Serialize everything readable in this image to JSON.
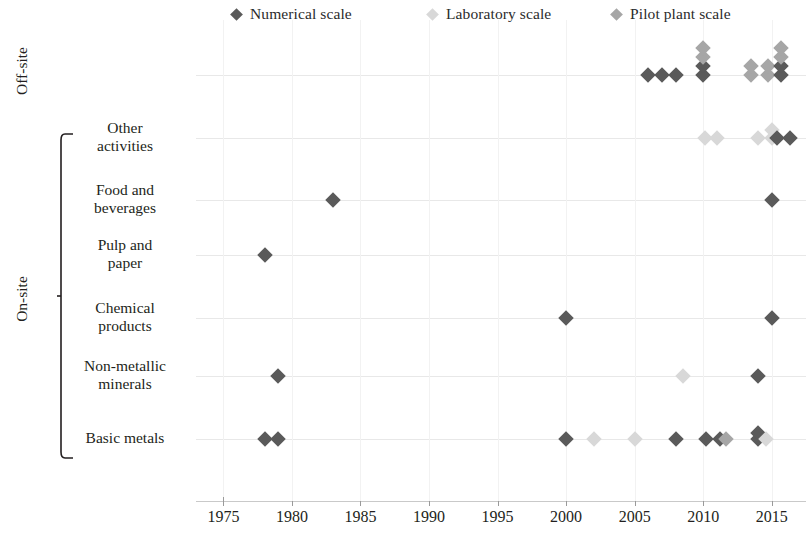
{
  "legend": {
    "entries": [
      {
        "label": "Numerical scale",
        "color": "#5a5a5a",
        "x": 232
      },
      {
        "label": "Laboratory scale",
        "color": "#d8d8d8",
        "x": 428
      },
      {
        "label": "Pilot plant  scale",
        "color": "#a6a6a6",
        "x": 612
      }
    ]
  },
  "axes": {
    "group_titles": [
      {
        "label": "Off-site"
      },
      {
        "label": "On-site"
      }
    ],
    "categories": [
      "Other\nactivities",
      "Food and\nbeverages",
      "Pulp and\npaper",
      "Chemical\nproducts",
      "Non-metallic\nminerals",
      "Basic metals"
    ],
    "x_ticks": [
      1975,
      1980,
      1985,
      1990,
      1995,
      2000,
      2005,
      2010,
      2015
    ],
    "x_tick_labels": [
      "1975",
      "1980",
      "1985",
      "1990",
      "1995",
      "2000",
      "2005",
      "2010",
      "2015"
    ]
  },
  "chart_data": {
    "type": "scatter",
    "title": "",
    "xlabel": "",
    "ylabel": "",
    "xlim": [
      1973,
      2017.5
    ],
    "grid": true,
    "legend_position": "top",
    "series": [
      {
        "name": "Numerical scale",
        "color": "#5a5a5a"
      },
      {
        "name": "Laboratory scale",
        "color": "#d8d8d8"
      },
      {
        "name": "Pilot plant  scale",
        "color": "#a6a6a6"
      }
    ],
    "rows": [
      {
        "category": "Off-site",
        "group": "Off-site",
        "points": [
          {
            "x": 2006.0,
            "series": "Numerical scale",
            "jitter": 0
          },
          {
            "x": 2007.0,
            "series": "Numerical scale",
            "jitter": 0
          },
          {
            "x": 2008.0,
            "series": "Numerical scale",
            "jitter": 0
          },
          {
            "x": 2010.0,
            "series": "Numerical scale",
            "jitter": 0
          },
          {
            "x": 2010.0,
            "series": "Numerical scale",
            "jitter": -9
          },
          {
            "x": 2010.0,
            "series": "Pilot plant  scale",
            "jitter": -18
          },
          {
            "x": 2010.0,
            "series": "Pilot plant  scale",
            "jitter": -27
          },
          {
            "x": 2013.5,
            "series": "Pilot plant  scale",
            "jitter": 0
          },
          {
            "x": 2013.5,
            "series": "Pilot plant  scale",
            "jitter": -9
          },
          {
            "x": 2014.7,
            "series": "Pilot plant  scale",
            "jitter": 0
          },
          {
            "x": 2014.7,
            "series": "Pilot plant  scale",
            "jitter": -9
          },
          {
            "x": 2015.7,
            "series": "Numerical scale",
            "jitter": 0
          },
          {
            "x": 2015.7,
            "series": "Numerical scale",
            "jitter": -9
          },
          {
            "x": 2015.7,
            "series": "Pilot plant  scale",
            "jitter": -18
          },
          {
            "x": 2015.7,
            "series": "Pilot plant  scale",
            "jitter": -27
          }
        ]
      },
      {
        "category": "Other\nactivities",
        "group": "On-site",
        "points": [
          {
            "x": 2010.1,
            "series": "Laboratory scale",
            "jitter": 0
          },
          {
            "x": 2011.0,
            "series": "Laboratory scale",
            "jitter": 0
          },
          {
            "x": 2014.0,
            "series": "Laboratory scale",
            "jitter": 0
          },
          {
            "x": 2015.0,
            "series": "Laboratory scale",
            "jitter": 0
          },
          {
            "x": 2015.0,
            "series": "Laboratory scale",
            "jitter": -8
          },
          {
            "x": 2015.4,
            "series": "Numerical scale",
            "jitter": 0
          },
          {
            "x": 2016.3,
            "series": "Numerical scale",
            "jitter": 0
          }
        ]
      },
      {
        "category": "Food and\nbeverages",
        "group": "On-site",
        "points": [
          {
            "x": 1983.0,
            "series": "Numerical scale",
            "jitter": 0
          },
          {
            "x": 2015.0,
            "series": "Numerical scale",
            "jitter": 0
          }
        ]
      },
      {
        "category": "Pulp and\npaper",
        "group": "On-site",
        "points": [
          {
            "x": 1978.0,
            "series": "Numerical scale",
            "jitter": 0
          }
        ]
      },
      {
        "category": "Chemical\nproducts",
        "group": "On-site",
        "points": [
          {
            "x": 2000.0,
            "series": "Numerical scale",
            "jitter": 0
          },
          {
            "x": 2015.0,
            "series": "Numerical scale",
            "jitter": 0
          }
        ]
      },
      {
        "category": "Non-metallic\nminerals",
        "group": "On-site",
        "points": [
          {
            "x": 1979.0,
            "series": "Numerical scale",
            "jitter": 0
          },
          {
            "x": 2008.5,
            "series": "Laboratory scale",
            "jitter": 0
          },
          {
            "x": 2014.0,
            "series": "Numerical scale",
            "jitter": 0
          }
        ]
      },
      {
        "category": "Basic metals",
        "group": "On-site",
        "points": [
          {
            "x": 1978.0,
            "series": "Numerical scale",
            "jitter": 0
          },
          {
            "x": 1979.0,
            "series": "Numerical scale",
            "jitter": 0
          },
          {
            "x": 2000.0,
            "series": "Numerical scale",
            "jitter": 0
          },
          {
            "x": 2002.0,
            "series": "Laboratory scale",
            "jitter": 0
          },
          {
            "x": 2005.0,
            "series": "Laboratory scale",
            "jitter": 0
          },
          {
            "x": 2008.0,
            "series": "Numerical scale",
            "jitter": 0
          },
          {
            "x": 2010.2,
            "series": "Numerical scale",
            "jitter": 0
          },
          {
            "x": 2011.2,
            "series": "Numerical scale",
            "jitter": 0
          },
          {
            "x": 2011.7,
            "series": "Pilot plant  scale",
            "jitter": 0
          },
          {
            "x": 2014.0,
            "series": "Numerical scale",
            "jitter": 0
          },
          {
            "x": 2014.0,
            "series": "Numerical scale",
            "jitter": -6
          },
          {
            "x": 2014.6,
            "series": "Laboratory scale",
            "jitter": 0
          }
        ]
      }
    ]
  }
}
